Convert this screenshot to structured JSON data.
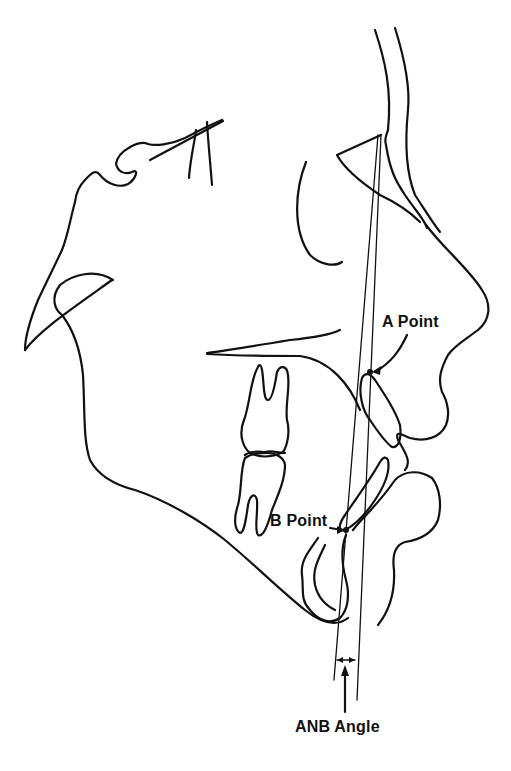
{
  "diagram": {
    "type": "lateral cephalometric tracing",
    "labels": {
      "a_point": "A Point",
      "b_point": "B Point",
      "anb_angle": "ANB Angle"
    },
    "colors": {
      "line": "#111111",
      "background": "#ffffff"
    },
    "landmarks": [
      {
        "name": "Nasion",
        "x": 381,
        "y": 135
      },
      {
        "name": "A Point",
        "x": 370,
        "y": 372
      },
      {
        "name": "B Point",
        "x": 346,
        "y": 530
      }
    ],
    "reference_lines": [
      {
        "name": "N-A line",
        "from": "Nasion",
        "to": "A Point"
      },
      {
        "name": "N-B line",
        "from": "Nasion",
        "to": "B Point"
      }
    ]
  }
}
